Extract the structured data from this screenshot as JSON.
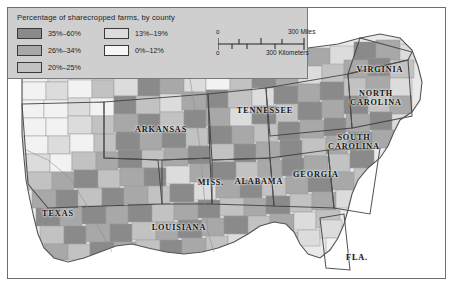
{
  "figure": {
    "type": "choropleth-map",
    "region": "Southern United States"
  },
  "legend": {
    "title": "Percentage of sharecropped farms, by county",
    "column1": [
      {
        "label": "35%–60%",
        "color": "#8a8a8a"
      },
      {
        "label": "26%–34%",
        "color": "#a8a8a8"
      },
      {
        "label": "20%–25%",
        "color": "#c2c2c2"
      }
    ],
    "column2": [
      {
        "label": "13%–19%",
        "color": "#dcdcdc"
      },
      {
        "label": "0%–12%",
        "color": "#f2f2f2"
      }
    ]
  },
  "scale": {
    "miles": {
      "zero": "0",
      "max": "300 Miles"
    },
    "kilometers": {
      "zero": "0",
      "max": "300 Kilometers"
    }
  },
  "states": [
    {
      "name": "VIRGINIA",
      "x": 372,
      "y": 64,
      "size": 8.2
    },
    {
      "name": "NORTH\nCAROLINA",
      "x": 368,
      "y": 90,
      "size": 8.2
    },
    {
      "name": "SOUTH\nCAROLINA",
      "x": 345,
      "y": 133,
      "size": 8.2
    },
    {
      "name": "TENNESSEE",
      "x": 256,
      "y": 105,
      "size": 8.2
    },
    {
      "name": "ARKANSAS",
      "x": 153,
      "y": 124,
      "size": 8.2
    },
    {
      "name": "MISS.",
      "x": 203,
      "y": 177,
      "size": 8.2
    },
    {
      "name": "ALABAMA",
      "x": 251,
      "y": 176,
      "size": 8.2
    },
    {
      "name": "GEORGIA",
      "x": 308,
      "y": 169,
      "size": 8.2
    },
    {
      "name": "TEXAS",
      "x": 50,
      "y": 208,
      "size": 8.2
    },
    {
      "name": "LOUISIANA",
      "x": 171,
      "y": 222,
      "size": 8.2
    },
    {
      "name": "FLA.",
      "x": 348,
      "y": 252,
      "size": 8.2
    }
  ],
  "colors": {
    "panel_border": "#6e6e6e",
    "legend_bg": "#cfcfcf",
    "ocean": "#ffffff",
    "county_line": "#9a9a9a",
    "state_line": "#3f3f3f"
  }
}
